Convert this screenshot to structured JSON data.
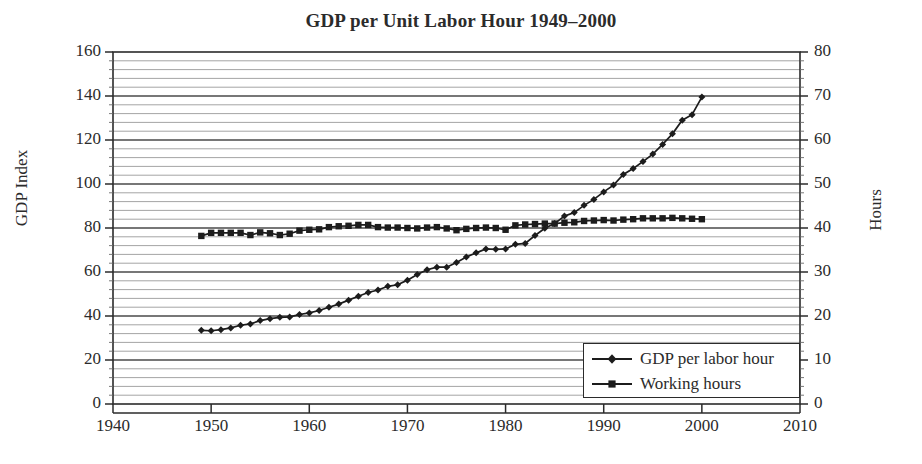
{
  "chart_data": {
    "type": "line",
    "title": "GDP per Unit Labor Hour 1949–2000",
    "xlabel": "",
    "ylabel": "GDP Index",
    "ylabel_secondary": "Hours",
    "xlim": [
      1940,
      2010
    ],
    "ylim": [
      0,
      160
    ],
    "ylim_secondary": [
      0,
      80
    ],
    "xticks": [
      1940,
      1950,
      1960,
      1970,
      1980,
      1990,
      2000,
      2010
    ],
    "yticks": [
      0,
      20,
      40,
      60,
      80,
      100,
      120,
      140,
      160
    ],
    "yticks_secondary": [
      0,
      10,
      20,
      30,
      40,
      50,
      60,
      70,
      80
    ],
    "grid": "horizontal major and minor",
    "minor_y_step": 4,
    "legend_position": "bottom-right",
    "series": [
      {
        "name": "GDP per labor hour",
        "axis": "left",
        "marker": "diamond",
        "color": "#1c1c1c",
        "x": [
          1949,
          1950,
          1951,
          1952,
          1953,
          1954,
          1955,
          1956,
          1957,
          1958,
          1959,
          1960,
          1961,
          1962,
          1963,
          1964,
          1965,
          1966,
          1967,
          1968,
          1969,
          1970,
          1971,
          1972,
          1973,
          1974,
          1975,
          1976,
          1977,
          1978,
          1979,
          1980,
          1981,
          1982,
          1983,
          1984,
          1985,
          1986,
          1987,
          1988,
          1989,
          1990,
          1991,
          1992,
          1993,
          1994,
          1995,
          1996,
          1997,
          1998,
          1999,
          2000
        ],
        "values": [
          33.5,
          33.3,
          33.8,
          34.6,
          35.8,
          36.4,
          37.9,
          38.8,
          39.4,
          39.6,
          40.7,
          41.4,
          42.5,
          44.0,
          45.4,
          47.2,
          49.0,
          50.7,
          51.8,
          53.5,
          54.2,
          56.3,
          58.9,
          61.0,
          62.2,
          62.2,
          64.3,
          66.8,
          68.7,
          70.5,
          70.3,
          70.5,
          72.6,
          73.0,
          76.6,
          79.9,
          82.0,
          85.4,
          87.0,
          90.3,
          93.0,
          96.4,
          99.5,
          104.3,
          107.0,
          110.2,
          113.6,
          118.0,
          122.8,
          129.0,
          131.5,
          139.5
        ]
      },
      {
        "name": "Working hours",
        "axis": "right",
        "marker": "square",
        "color": "#1c1c1c",
        "x": [
          1949,
          1950,
          1951,
          1952,
          1953,
          1954,
          1955,
          1956,
          1957,
          1958,
          1959,
          1960,
          1961,
          1962,
          1963,
          1964,
          1965,
          1966,
          1967,
          1968,
          1969,
          1970,
          1971,
          1972,
          1973,
          1974,
          1975,
          1976,
          1977,
          1978,
          1979,
          1980,
          1981,
          1982,
          1983,
          1984,
          1985,
          1986,
          1987,
          1988,
          1989,
          1990,
          1991,
          1992,
          1993,
          1994,
          1995,
          1996,
          1997,
          1998,
          1999,
          2000
        ],
        "values": [
          38.2,
          38.9,
          38.9,
          38.9,
          38.9,
          38.4,
          39.0,
          38.8,
          38.4,
          38.7,
          39.4,
          39.6,
          39.7,
          40.2,
          40.4,
          40.5,
          40.7,
          40.7,
          40.2,
          40.1,
          40.1,
          40.0,
          39.9,
          40.1,
          40.2,
          39.9,
          39.5,
          39.8,
          40.0,
          40.1,
          40.0,
          39.6,
          40.6,
          40.8,
          40.9,
          41.0,
          41.0,
          41.2,
          41.3,
          41.6,
          41.7,
          41.8,
          41.7,
          41.9,
          42.0,
          42.2,
          42.2,
          42.2,
          42.3,
          42.2,
          42.1,
          42.0
        ]
      }
    ]
  },
  "axes": {
    "left_title": "GDP Index",
    "right_title": "Hours"
  },
  "legend": {
    "items": [
      {
        "label": "GDP per labor hour",
        "marker": "diamond-marker"
      },
      {
        "label": "Working hours",
        "marker": "square-marker"
      }
    ]
  }
}
